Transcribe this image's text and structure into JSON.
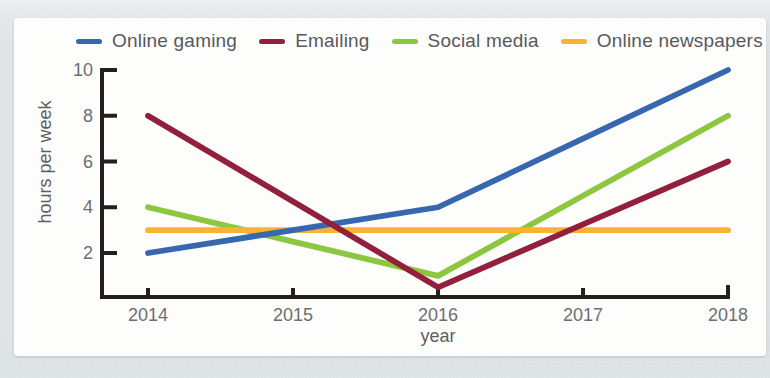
{
  "axis": {
    "line_color": "#231f20",
    "tick_label_color": "#6d6e71",
    "legend_text_color": "#58595b"
  },
  "chart_data": {
    "type": "line",
    "title": "",
    "xlabel": "year",
    "ylabel": "hours per week",
    "x": [
      2014,
      2015,
      2016,
      2017,
      2018
    ],
    "x_tick_labels": [
      "2014",
      "2015",
      "2016",
      "2017",
      "2018"
    ],
    "y_ticks": [
      2,
      4,
      6,
      8,
      10
    ],
    "ylim": [
      0,
      10
    ],
    "grid": false,
    "legend_position": "top",
    "series": [
      {
        "name": "Online gaming",
        "color": "#3767af",
        "values": [
          2,
          3,
          4,
          7,
          10
        ]
      },
      {
        "name": "Emailing",
        "color": "#92203c",
        "values": [
          8,
          4.25,
          0.5,
          3.25,
          6
        ]
      },
      {
        "name": "Social media",
        "color": "#8dc63f",
        "values": [
          4,
          2.5,
          1,
          4.5,
          8
        ]
      },
      {
        "name": "Online newspapers",
        "color": "#f9b233",
        "values": [
          3,
          3,
          3,
          3,
          3
        ]
      }
    ],
    "z_order": [
      "Social media",
      "Online newspapers",
      "Online gaming",
      "Emailing"
    ]
  }
}
